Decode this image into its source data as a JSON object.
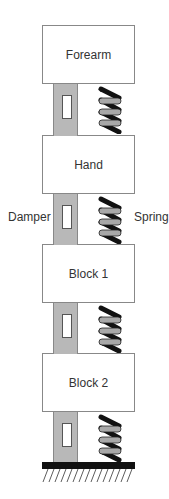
{
  "blocks": [
    {
      "label": "Forearm"
    },
    {
      "label": "Hand"
    },
    {
      "label": "Block 1"
    },
    {
      "label": "Block 2"
    }
  ],
  "labels": {
    "damper": "Damper",
    "spring": "Spring"
  },
  "colors": {
    "damper_fill": "#b8b8b8",
    "spring_coil": "#111111",
    "spring_fill": "#a8a8a8",
    "ground": "#111111"
  }
}
